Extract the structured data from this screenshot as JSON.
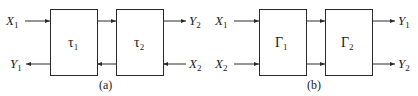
{
  "diagram_a": {
    "caption": "(a)",
    "blocks": [
      {
        "symbol": "τ",
        "subscript": "1"
      },
      {
        "symbol": "τ",
        "subscript": "2"
      }
    ],
    "ports": {
      "in_top": {
        "name": "X",
        "sub": "1"
      },
      "out_bottom": {
        "name": "Y",
        "sub": "1"
      },
      "out_top": {
        "name": "Y",
        "sub": "2"
      },
      "in_bottom": {
        "name": "X",
        "sub": "2"
      }
    }
  },
  "diagram_b": {
    "caption": "(b)",
    "blocks": [
      {
        "symbol": "Γ",
        "subscript": "1"
      },
      {
        "symbol": "Γ",
        "subscript": "2"
      }
    ],
    "ports": {
      "in_top": {
        "name": "X",
        "sub": "1"
      },
      "in_bottom": {
        "name": "X",
        "sub": "2"
      },
      "out_top": {
        "name": "Y",
        "sub": "1"
      },
      "out_bottom": {
        "name": "Y",
        "sub": "2"
      }
    }
  }
}
